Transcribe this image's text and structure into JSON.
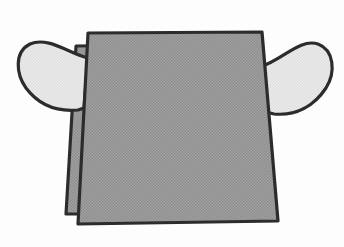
{
  "canvas": {
    "width": 344,
    "height": 247,
    "background_color": "#fdfdfd"
  },
  "illustration": {
    "subject": "garment-front-panel-with-sleeves",
    "title": "",
    "style": "line-art-halftone-shading",
    "outline_color": "#2c2c2c",
    "outline_width": 3.2,
    "body_fill_color": "#9a9a9a",
    "body_halftone_dot_color": "#8a8a8a",
    "back_panel_fill_color": "#9a9a9a",
    "sleeve_fill_color": "#e9e9e9",
    "sleeve_halftone_dot_color": "#dcdcdc",
    "parts": [
      {
        "name": "back-panel",
        "label": "Back panel layer",
        "fill": "#9a9a9a",
        "path": "M 76 46 L 250 44 L 266 214 L 66 214 Z"
      },
      {
        "name": "left-sleeve",
        "label": "Left sleeve",
        "fill": "#e9e9e9",
        "path": "M 88 58 C 70 54 48 36 30 44 C 14 52 16 74 26 88 C 38 104 56 112 78 110 L 84 108 Z"
      },
      {
        "name": "right-sleeve",
        "label": "Right sleeve",
        "fill": "#e9e9e9",
        "path": "M 262 66 C 282 60 300 38 318 44 C 334 50 336 72 326 88 C 314 106 296 116 274 114 L 266 112 Z"
      },
      {
        "name": "front-panel",
        "label": "Front body panel",
        "fill": "#9a9a9a",
        "path": "M 88 33 L 262 32 L 278 221 L 78 224 Z"
      }
    ]
  }
}
